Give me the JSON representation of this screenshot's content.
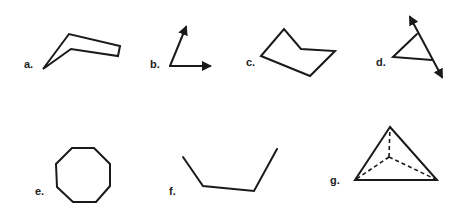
{
  "figures": [
    {
      "id": "a",
      "label": "a.",
      "type": "concave-polygon",
      "label_pos": [
        24,
        68
      ],
      "points": [
        [
          43,
          69
        ],
        [
          69,
          34
        ],
        [
          120,
          46
        ],
        [
          118,
          56
        ],
        [
          71,
          49
        ]
      ]
    },
    {
      "id": "b",
      "label": "b.",
      "type": "two-rays",
      "label_pos": [
        150,
        68
      ],
      "origin": [
        170,
        66
      ],
      "rays": [
        [
          187,
          24
        ],
        [
          213,
          66
        ]
      ]
    },
    {
      "id": "c",
      "label": "c.",
      "type": "concave-polygon",
      "label_pos": [
        246,
        66
      ],
      "points": [
        [
          261,
          56
        ],
        [
          284,
          29
        ],
        [
          301,
          49
        ],
        [
          335,
          51
        ],
        [
          310,
          76
        ]
      ]
    },
    {
      "id": "d",
      "label": "d.",
      "type": "triangle-with-line",
      "label_pos": [
        376,
        66
      ],
      "triangle": [
        [
          393,
          57
        ],
        [
          417,
          34
        ],
        [
          432,
          60
        ]
      ],
      "line": [
        [
          409,
          14
        ],
        [
          443,
          80
        ]
      ]
    },
    {
      "id": "e",
      "label": "e.",
      "type": "octagon",
      "label_pos": [
        35,
        195
      ],
      "points": [
        [
          72,
          148
        ],
        [
          94,
          148
        ],
        [
          110,
          164
        ],
        [
          110,
          186
        ],
        [
          96,
          202
        ],
        [
          73,
          202
        ],
        [
          57,
          187
        ],
        [
          56,
          164
        ]
      ]
    },
    {
      "id": "f",
      "label": "f.",
      "type": "open-polyline",
      "label_pos": [
        169,
        195
      ],
      "points": [
        [
          183,
          157
        ],
        [
          203,
          186
        ],
        [
          254,
          191
        ],
        [
          277,
          149
        ]
      ]
    },
    {
      "id": "g",
      "label": "g.",
      "type": "tetrahedron",
      "label_pos": [
        330,
        184
      ],
      "triangle": [
        [
          390,
          127
        ],
        [
          355,
          180
        ],
        [
          437,
          180
        ]
      ],
      "center": [
        389,
        157
      ]
    }
  ]
}
